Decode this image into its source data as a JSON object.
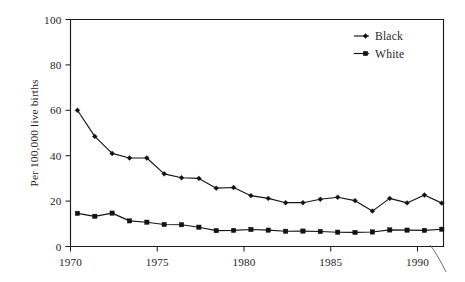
{
  "chart_data": {
    "type": "line",
    "title": "",
    "subtitle": "",
    "xlabel": "",
    "ylabel": "Per 100,000 live births",
    "xlim": [
      1970,
      1991.5
    ],
    "ylim": [
      0,
      100
    ],
    "grid": false,
    "legend_position": "top-right",
    "x_ticks": [
      1970,
      1975,
      1980,
      1985,
      1990
    ],
    "x_tick_labels": [
      "1970",
      "1975",
      "1980",
      "1985",
      "1990"
    ],
    "y_ticks": [
      0,
      20,
      40,
      60,
      80,
      100
    ],
    "y_tick_labels": [
      "0",
      "20",
      "40",
      "60",
      "80",
      "100"
    ],
    "x": [
      1970.4,
      1971.4,
      1972.4,
      1973.4,
      1974.4,
      1975.4,
      1976.4,
      1977.4,
      1978.4,
      1979.4,
      1980.4,
      1981.4,
      1982.4,
      1983.4,
      1984.4,
      1985.4,
      1986.4,
      1987.4,
      1988.4,
      1989.4,
      1990.4,
      1991.4
    ],
    "series": [
      {
        "name": "Black",
        "marker": "diamond",
        "color": "#121212",
        "values": [
          60.0,
          48.5,
          41.0,
          39.0,
          39.0,
          32.0,
          30.3,
          30.0,
          25.7,
          26.0,
          22.4,
          21.2,
          19.3,
          19.3,
          20.8,
          21.7,
          20.2,
          15.6,
          21.2,
          19.2,
          22.7,
          19.1
        ]
      },
      {
        "name": "White",
        "marker": "square",
        "color": "#121212",
        "values": [
          14.6,
          13.3,
          14.7,
          11.3,
          10.7,
          9.7,
          9.6,
          8.5,
          7.0,
          7.1,
          7.5,
          7.2,
          6.7,
          6.8,
          6.6,
          6.3,
          6.2,
          6.4,
          7.3,
          7.2,
          7.1,
          7.6
        ]
      }
    ]
  },
  "legend": {
    "entries": [
      {
        "label": "Black",
        "marker": "diamond"
      },
      {
        "label": "White",
        "marker": "square"
      }
    ]
  },
  "axes": {
    "y_axis_title": "Per 100,000 live births"
  },
  "artifacts": {
    "page_curl_name": "page-curl-mark"
  }
}
